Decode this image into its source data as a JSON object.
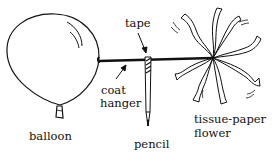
{
  "diagram": {
    "labels": {
      "tape": "tape",
      "coat_hanger_line1": "coat",
      "coat_hanger_line2": "hanger",
      "balloon": "balloon",
      "pencil": "pencil",
      "flower_line1": "tissue-paper",
      "flower_line2": "flower"
    },
    "components": [
      "balloon",
      "coat hanger",
      "tape",
      "pencil",
      "tissue-paper flower"
    ],
    "colors": {
      "ink": "#111111",
      "background": "#ffffff"
    }
  }
}
